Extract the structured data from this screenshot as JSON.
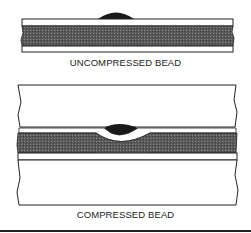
{
  "figures": {
    "top": {
      "label": "UNCOMPRESSED BEAD"
    },
    "bottom": {
      "label": "COMPRESSED BEAD"
    }
  },
  "colors": {
    "line": "#222222",
    "fill_dark": "#555555",
    "bead": "#1a1a1a"
  }
}
